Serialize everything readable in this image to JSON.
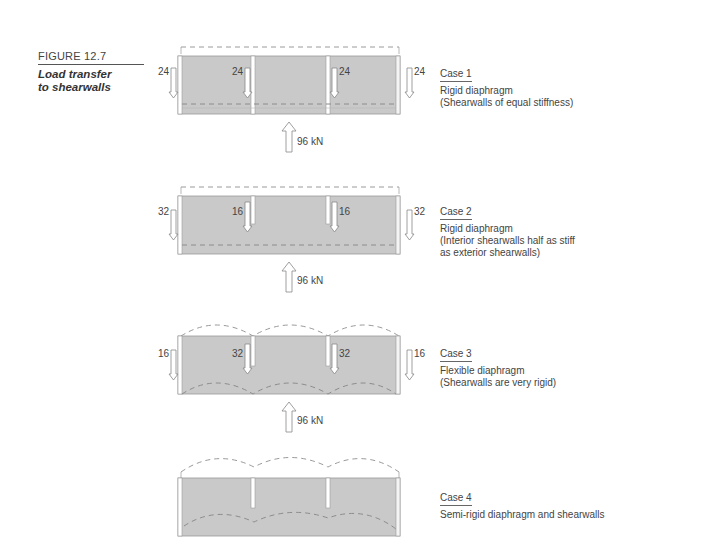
{
  "figure": {
    "number": "FIGURE 12.7",
    "title_line1": "Load transfer",
    "title_line2": "to shearwalls"
  },
  "colors": {
    "diaphragm_fill": "#c9c9c9",
    "dash": "#9a9a9a",
    "outline": "#8a8a8a",
    "text": "#444444"
  },
  "cases": [
    {
      "title": "Case 1",
      "desc_lines": [
        "Rigid diaphragm",
        "(Shearwalls of equal stiffness)"
      ],
      "reactions": {
        "left_exterior": "24",
        "left_interior": "24",
        "right_interior": "24",
        "right_exterior": "24"
      },
      "load": "96 kN",
      "deflected_shape": "straight"
    },
    {
      "title": "Case 2",
      "desc_lines": [
        "Rigid diaphragm",
        "(Interior shearwalls half as stiff",
        "as exterior shearwalls)"
      ],
      "reactions": {
        "left_exterior": "32",
        "left_interior": "16",
        "right_interior": "16",
        "right_exterior": "32"
      },
      "load": "96 kN",
      "deflected_shape": "straight"
    },
    {
      "title": "Case 3",
      "desc_lines": [
        "Flexible diaphragm",
        "(Shearwalls are very rigid)"
      ],
      "reactions": {
        "left_exterior": "16",
        "left_interior": "32",
        "right_interior": "32",
        "right_exterior": "16"
      },
      "load": "96 kN",
      "deflected_shape": "arched"
    },
    {
      "title": "Case 4",
      "desc_lines": [
        "Semi-rigid diaphragm and shearwalls"
      ],
      "deflected_shape": "wavy"
    }
  ]
}
